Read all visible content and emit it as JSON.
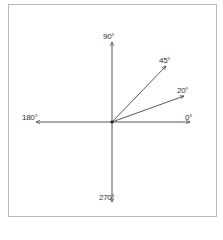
{
  "diagram": {
    "type": "angle-vectors",
    "origin": {
      "x": 112,
      "y": 122
    },
    "colors": {
      "line": "#444444",
      "frame": "#b8b8b8",
      "text": "#333333",
      "background": "#ffffff"
    },
    "vectors": [
      {
        "id": "v0",
        "angle": 0,
        "label": "0°",
        "tip": {
          "x": 190,
          "y": 122
        },
        "label_pos": {
          "x": 185,
          "y": 114
        }
      },
      {
        "id": "v20",
        "angle": 20,
        "label": "20°",
        "tip": {
          "x": 184,
          "y": 96
        },
        "label_pos": {
          "x": 177,
          "y": 87
        }
      },
      {
        "id": "v45",
        "angle": 45,
        "label": "45°",
        "tip": {
          "x": 166,
          "y": 66
        },
        "label_pos": {
          "x": 159,
          "y": 57
        }
      },
      {
        "id": "v90",
        "angle": 90,
        "label": "90°",
        "tip": {
          "x": 112,
          "y": 42
        },
        "label_pos": {
          "x": 103,
          "y": 33
        }
      },
      {
        "id": "v180",
        "angle": 180,
        "label": "180°",
        "tip": {
          "x": 36,
          "y": 122
        },
        "label_pos": {
          "x": 22,
          "y": 114
        }
      },
      {
        "id": "v270",
        "angle": 270,
        "label": "270°",
        "tip": {
          "x": 112,
          "y": 202
        },
        "label_pos": {
          "x": 99,
          "y": 194
        }
      }
    ]
  }
}
